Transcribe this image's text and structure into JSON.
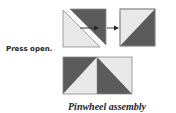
{
  "labels": {
    "step": "Press open.",
    "caption": "Pinwheel assembly"
  },
  "colors": {
    "dark": "#5b5b5b",
    "light": "#e9e9e9",
    "outline": "#8a8a8a",
    "arrow": "#333333"
  },
  "figures": [
    {
      "id": "sewn-squares-pair",
      "description": "Two stacked squares sewn and cut along diagonal"
    },
    {
      "id": "half-square-triangle",
      "description": "Opened half-square triangle unit"
    },
    {
      "id": "pinwheel-row",
      "description": "Two half-square triangle units joined"
    }
  ]
}
